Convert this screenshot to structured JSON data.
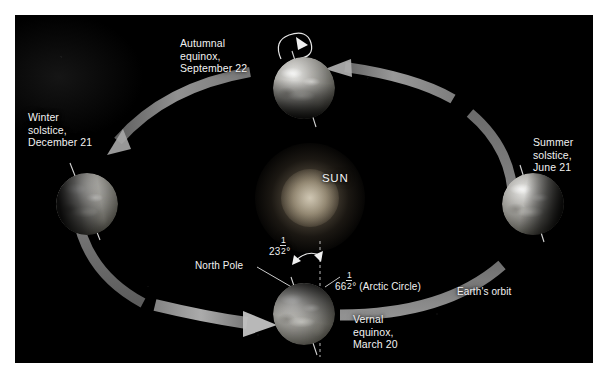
{
  "figure": {
    "background_color": "#ffffff",
    "panel_color": "#020202"
  },
  "sun": {
    "label": "SUN",
    "glow_color": "#ffeecd"
  },
  "orbit": {
    "label": "Earth's orbit",
    "color": "#9a9a9a",
    "direction": "counterclockwise"
  },
  "axis_annotations": {
    "north_pole_label": "North Pole",
    "tilt_value": "23",
    "tilt_fraction_numerator": "1",
    "tilt_fraction_denominator": "2",
    "tilt_degree": "°",
    "tilt_full": "23½°",
    "arctic_value": "66",
    "arctic_fraction_numerator": "1",
    "arctic_fraction_denominator": "2",
    "arctic_degree": "°",
    "arctic_suffix": " (Arctic Circle)",
    "arctic_full": "66½° (Arctic Circle)"
  },
  "positions": [
    {
      "id": "autumnal-equinox",
      "season_line1": "Autumnal",
      "season_line2": "equinox,",
      "date": "September 22",
      "label": "Autumnal\nequinox,\nSeptember 22"
    },
    {
      "id": "winter-solstice",
      "season_line1": "Winter",
      "season_line2": "solstice,",
      "date": "December 21",
      "label": "Winter\nsolstice,\nDecember 21"
    },
    {
      "id": "vernal-equinox",
      "season_line1": "Vernal",
      "season_line2": "equinox,",
      "date": "March 20",
      "label": "Vernal\nequinox,\nMarch 20"
    },
    {
      "id": "summer-solstice",
      "season_line1": "Summer",
      "season_line2": "solstice,",
      "date": "June 21",
      "label": "Summer\nsolstice,\nJune 21"
    }
  ]
}
